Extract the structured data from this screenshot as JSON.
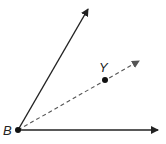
{
  "diagram": {
    "type": "angle-with-bisector",
    "vertex": {
      "label": "B",
      "x": 18,
      "y": 130
    },
    "rays": [
      {
        "name": "upper-ray",
        "style": "solid",
        "to": {
          "x": 88,
          "y": 9
        }
      },
      {
        "name": "lower-ray",
        "style": "solid",
        "to": {
          "x": 158,
          "y": 130
        }
      },
      {
        "name": "dashed-ray",
        "style": "dashed",
        "to": {
          "x": 139,
          "y": 61
        }
      }
    ],
    "points": [
      {
        "label": "Y",
        "x": 105,
        "y": 80
      }
    ],
    "colors": {
      "line": "#222222",
      "dashed": "#555555",
      "background": "#ffffff"
    }
  }
}
